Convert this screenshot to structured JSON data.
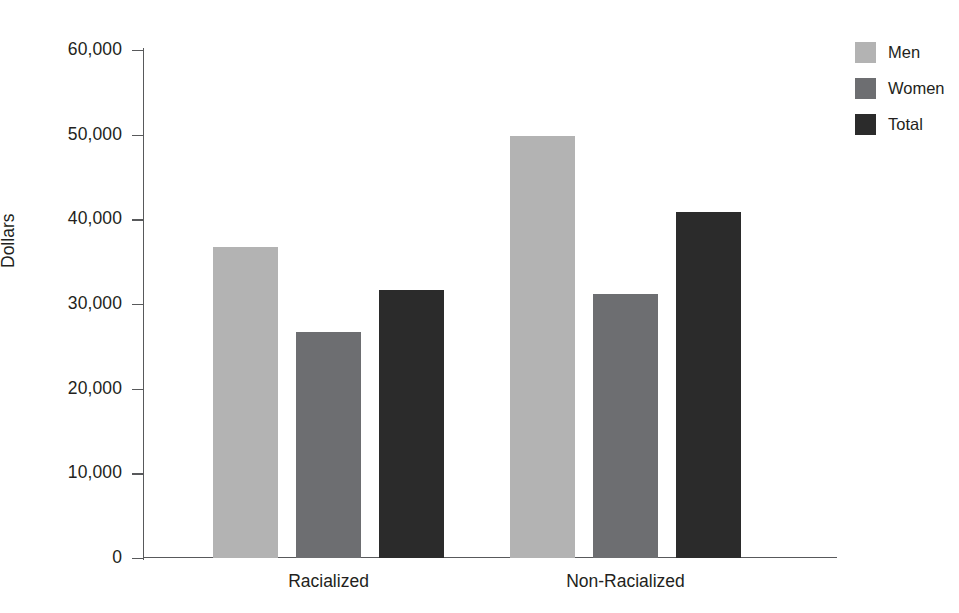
{
  "chart_data": {
    "type": "bar",
    "title": "",
    "xlabel": "",
    "ylabel": "Dollars",
    "ylim": [
      0,
      60000
    ],
    "grid": false,
    "legend_position": "right-top",
    "categories": [
      "Racialized",
      "Non-Racialized"
    ],
    "y_ticks": [
      {
        "value": 60000,
        "label": "60,000"
      },
      {
        "value": 50000,
        "label": "50,000"
      },
      {
        "value": 40000,
        "label": "40,000"
      },
      {
        "value": 30000,
        "label": "30,000"
      },
      {
        "value": 20000,
        "label": "20,000"
      },
      {
        "value": 10000,
        "label": "10,000"
      },
      {
        "value": 0,
        "label": "0"
      }
    ],
    "series": [
      {
        "name": "Men",
        "color": "#b3b3b3",
        "values": [
          36700,
          49900
        ]
      },
      {
        "name": "Women",
        "color": "#6d6e71",
        "values": [
          26700,
          31200
        ]
      },
      {
        "name": "Total",
        "color": "#2b2b2b",
        "values": [
          31700,
          40900
        ]
      }
    ]
  },
  "legend": {
    "items": [
      {
        "label": "Men",
        "color": "#b3b3b3"
      },
      {
        "label": "Women",
        "color": "#6d6e71"
      },
      {
        "label": "Total",
        "color": "#2b2b2b"
      }
    ]
  },
  "axis": {
    "y_title": "Dollars"
  }
}
